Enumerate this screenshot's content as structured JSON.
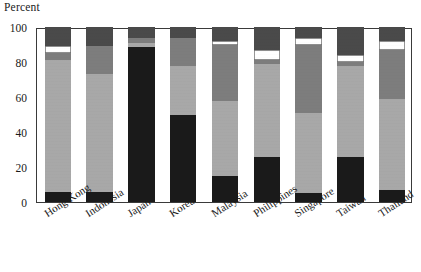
{
  "chart_data": {
    "type": "bar",
    "subtype": "stacked-bar-100",
    "title": "",
    "axis_title": "Percent",
    "xlabel": "",
    "ylabel": "Percent",
    "ylim": [
      0,
      100
    ],
    "yticks": [
      0,
      20,
      40,
      60,
      80,
      100
    ],
    "grid": false,
    "legend_position": "none",
    "categories": [
      "Hong Kong",
      "Indonesia",
      "Japan",
      "Korea",
      "Malaysia",
      "Philippines",
      "Singapore",
      "Taiwan",
      "Thailand"
    ],
    "series": [
      {
        "name": "segment-1-black",
        "color": "#1a1a1a",
        "values": [
          6,
          6,
          88.5,
          50,
          15,
          26,
          5,
          26,
          7
        ]
      },
      {
        "name": "segment-2-light-gray",
        "color": "#a8a8a8",
        "values": [
          75,
          67,
          2.5,
          28,
          43,
          53,
          46,
          52,
          52
        ]
      },
      {
        "name": "segment-3-medium-gray",
        "color": "#7d7d7d",
        "values": [
          4,
          16,
          3,
          16,
          32,
          2,
          39,
          2,
          28
        ]
      },
      {
        "name": "segment-4-white",
        "color": "#ffffff",
        "values": [
          4,
          0,
          0,
          0,
          2,
          6,
          4,
          4,
          5
        ]
      },
      {
        "name": "segment-5-dark-gray",
        "color": "#4a4a4a",
        "values": [
          11,
          11,
          6,
          6,
          8,
          13,
          6,
          16,
          8
        ]
      }
    ]
  },
  "colors": {
    "axis": "#3a3a3a",
    "text": "#1a1a1a",
    "background": "#ffffff",
    "black": "#1a1a1a",
    "light_gray": "#a8a8a8",
    "medium_gray": "#7d7d7d",
    "white": "#ffffff",
    "dark_gray": "#4a4a4a"
  }
}
